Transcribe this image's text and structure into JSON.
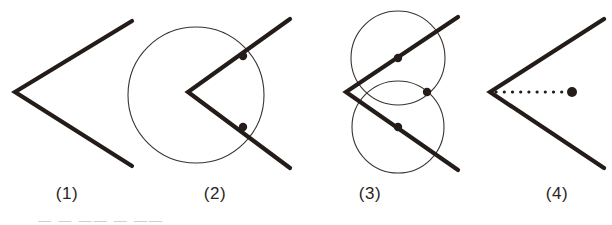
{
  "document": {
    "kind": "geometry-construction-figure",
    "panel_count": 4,
    "background_color": "#ffffff",
    "ink_color": "#241c18",
    "thin_line_color": "#3a332e"
  },
  "captions": {
    "panel_1": "(1)",
    "panel_2": "(2)",
    "panel_3": "(3)",
    "panel_4": "(4)"
  },
  "footer": {
    "clipped_text": "— — —— — ——"
  },
  "panels": [
    {
      "id": "panel-1",
      "caption": "(1)",
      "description": "An angle drawn as a V opening to the right",
      "vertex": {
        "x": 15,
        "y": 92
      },
      "rays": [
        {
          "name": "upper-ray",
          "from": [
            15,
            92
          ],
          "to": [
            132,
            21
          ]
        },
        {
          "name": "lower-ray",
          "from": [
            15,
            92
          ],
          "to": [
            132,
            166
          ]
        }
      ],
      "circles": [],
      "points": []
    },
    {
      "id": "panel-2",
      "caption": "(2)",
      "description": "Arc centered at the vertex cuts both rays at two marked points",
      "vertex": {
        "x": 188,
        "y": 92
      },
      "rays": [
        {
          "name": "upper-ray",
          "from": [
            188,
            92
          ],
          "to": [
            290,
            19
          ]
        },
        {
          "name": "lower-ray",
          "from": [
            188,
            92
          ],
          "to": [
            290,
            168
          ]
        }
      ],
      "circles": [
        {
          "name": "vertex-arc",
          "cx": 196,
          "cy": 95,
          "r": 68
        }
      ],
      "points": [
        {
          "name": "intersection-upper",
          "x": 243,
          "y": 56
        },
        {
          "name": "intersection-lower",
          "x": 243,
          "y": 127
        }
      ]
    },
    {
      "id": "panel-3",
      "caption": "(3)",
      "description": "Two equal arcs centered on the previous points cross each other",
      "vertex": {
        "x": 346,
        "y": 92
      },
      "rays": [
        {
          "name": "upper-ray",
          "from": [
            346,
            92
          ],
          "to": [
            458,
            17
          ]
        },
        {
          "name": "lower-ray",
          "from": [
            346,
            92
          ],
          "to": [
            458,
            170
          ]
        }
      ],
      "circles": [
        {
          "name": "arc-upper",
          "cx": 398,
          "cy": 58,
          "r": 47
        },
        {
          "name": "arc-lower",
          "cx": 398,
          "cy": 127,
          "r": 46
        }
      ],
      "points": [
        {
          "name": "center-upper",
          "x": 398,
          "y": 58
        },
        {
          "name": "center-lower",
          "x": 398,
          "y": 127
        },
        {
          "name": "arc-crossing",
          "x": 427,
          "y": 92
        }
      ]
    },
    {
      "id": "panel-4",
      "caption": "(4)",
      "description": "Dotted bisector ray from the vertex to the crossing point",
      "vertex": {
        "x": 490,
        "y": 92
      },
      "rays": [
        {
          "name": "upper-ray",
          "from": [
            490,
            92
          ],
          "to": [
            604,
            19
          ]
        },
        {
          "name": "lower-ray",
          "from": [
            490,
            92
          ],
          "to": [
            604,
            168
          ]
        }
      ],
      "circles": [],
      "dotted_segment": {
        "name": "bisector",
        "from": [
          494,
          92
        ],
        "to": [
          566,
          92
        ]
      },
      "points": [
        {
          "name": "bisector-endpoint",
          "x": 572,
          "y": 92
        }
      ]
    }
  ],
  "style_values": {
    "ray_stroke_width": 4.2,
    "circle_stroke_width": 1.1,
    "point_radius": 4.2,
    "dot_radius": 1.5,
    "dot_spacing": 8
  }
}
